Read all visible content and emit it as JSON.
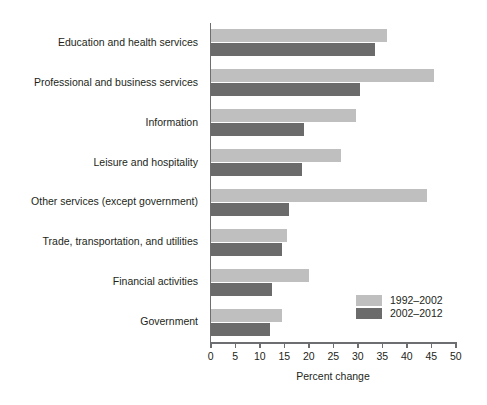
{
  "chart_data": {
    "type": "bar",
    "orientation": "horizontal",
    "title": "",
    "xlabel": "Percent change",
    "ylabel": "",
    "xlim": [
      0,
      50
    ],
    "xticks": [
      0,
      5,
      10,
      15,
      20,
      25,
      30,
      35,
      40,
      45,
      50
    ],
    "grid": false,
    "legend_position": "inside-lower-right",
    "categories": [
      "Education and health services",
      "Professional and business services",
      "Information",
      "Leisure and hospitality",
      "Other services (except government)",
      "Trade, transportation, and utilities",
      "Financial activities",
      "Government"
    ],
    "series": [
      {
        "name": "1992–2002",
        "color": "#bfbfbf",
        "values": [
          36.0,
          45.5,
          29.5,
          26.5,
          44.0,
          15.5,
          20.0,
          14.5
        ]
      },
      {
        "name": "2002–2012",
        "color": "#6b6b6b",
        "values": [
          33.5,
          30.5,
          19.0,
          18.5,
          16.0,
          14.5,
          12.5,
          12.0
        ]
      }
    ]
  },
  "legend": {
    "items": [
      {
        "label": "1992–2002",
        "color": "#bfbfbf"
      },
      {
        "label": "2002–2012",
        "color": "#6b6b6b"
      }
    ]
  }
}
